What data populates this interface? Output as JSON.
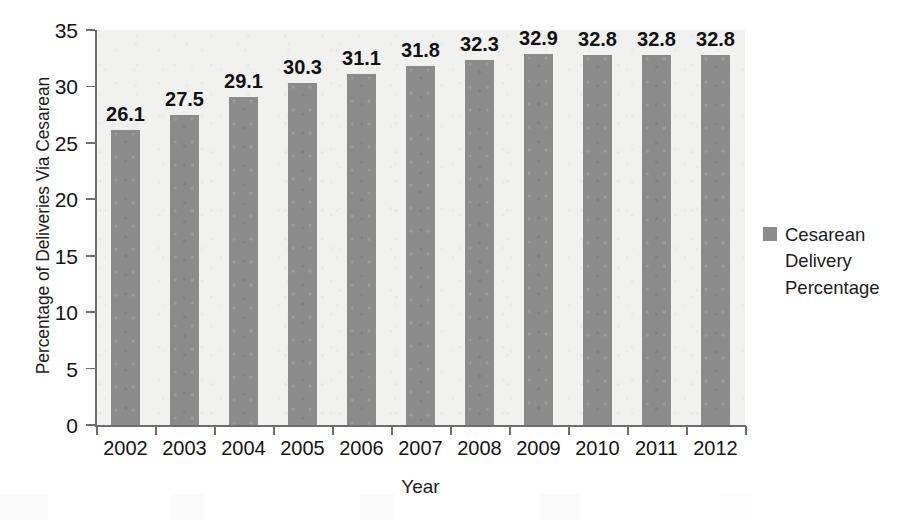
{
  "chart_data": {
    "type": "bar",
    "title": "",
    "xlabel": "Year",
    "ylabel": "Percentage of Deliveries Via Cesarean",
    "categories": [
      "2002",
      "2003",
      "2004",
      "2005",
      "2006",
      "2007",
      "2008",
      "2009",
      "2010",
      "2011",
      "2012"
    ],
    "values": [
      26.1,
      27.5,
      29.1,
      30.3,
      31.1,
      31.8,
      32.3,
      32.9,
      32.8,
      32.8,
      32.8
    ],
    "value_labels": [
      "26.1",
      "27.5",
      "29.1",
      "30.3",
      "31.1",
      "31.8",
      "32.3",
      "32.9",
      "32.8",
      "32.8",
      "32.8"
    ],
    "series": [
      {
        "name": "Cesarean Delivery Percentage",
        "values": [
          26.1,
          27.5,
          29.1,
          30.3,
          31.1,
          31.8,
          32.3,
          32.9,
          32.8,
          32.8,
          32.8
        ],
        "color": "#8c8b8b"
      }
    ],
    "ylim": [
      0,
      35
    ],
    "y_ticks": [
      0,
      5,
      10,
      15,
      20,
      25,
      30,
      35
    ],
    "y_tick_labels": [
      "0",
      "5",
      "10",
      "15",
      "20",
      "25",
      "30",
      "35"
    ],
    "grid": false,
    "legend_position": "right",
    "legend_entries": [
      "Cesarean Delivery Percentage"
    ],
    "data_labels_shown": true
  },
  "legend": {
    "label": "Cesarean Delivery Percentage",
    "swatch_color": "#8c8b8b"
  },
  "axes": {
    "x_title": "Year",
    "y_title": "Percentage of Deliveries Via Cesarean"
  },
  "colors": {
    "bar": "#8c8b8b",
    "plot_background": "#f1f1f0",
    "axis_line": "#6e6e6e",
    "text": "#141414"
  }
}
